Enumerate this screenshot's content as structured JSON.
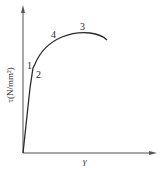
{
  "diagram": {
    "type": "shear stress-strain curve",
    "y_axis_label": "τ(N/mm²)",
    "x_axis_label": "γ",
    "point_labels": {
      "p1": "1",
      "p2": "2",
      "p3": "3",
      "p4": "4"
    },
    "colors": {
      "line": "#2a2a2a",
      "axis": "#555555",
      "background": "#ffffff"
    }
  }
}
